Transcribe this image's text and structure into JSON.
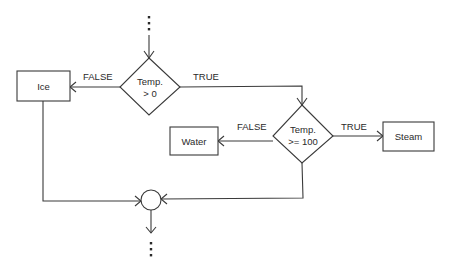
{
  "diagram": {
    "type": "flowchart",
    "nodes": {
      "ice": {
        "label": "Ice",
        "shape": "process"
      },
      "decision1": {
        "line1": "Temp.",
        "line2": "> 0",
        "shape": "decision"
      },
      "water": {
        "label": "Water",
        "shape": "process"
      },
      "decision2": {
        "line1": "Temp.",
        "line2": ">= 100",
        "shape": "decision"
      },
      "steam": {
        "label": "Steam",
        "shape": "process"
      },
      "junction": {
        "shape": "connector"
      }
    },
    "edges": {
      "d1_false": {
        "from": "decision1",
        "to": "ice",
        "label": "FALSE"
      },
      "d1_true": {
        "from": "decision1",
        "to": "decision2",
        "label": "TRUE"
      },
      "d2_false": {
        "from": "decision2",
        "to": "water",
        "label": "FALSE"
      },
      "d2_true": {
        "from": "decision2",
        "to": "steam",
        "label": "TRUE"
      },
      "ice_to_junction": {
        "from": "ice",
        "to": "junction"
      },
      "d2_to_junction": {
        "from": "decision2",
        "to": "junction"
      }
    },
    "continuation": {
      "top": "⋮",
      "bottom": "⋮"
    },
    "colors": {
      "stroke": "#3a3a3a",
      "text": "#2a2a2a",
      "background": "#ffffff"
    }
  }
}
